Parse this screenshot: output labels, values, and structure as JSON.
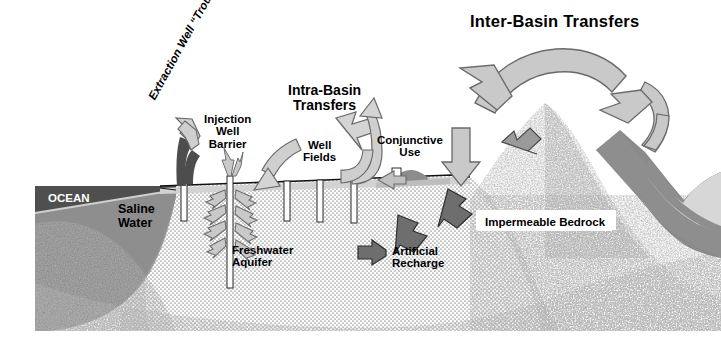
{
  "figure": {
    "type": "cross-section-diagram"
  },
  "labels": {
    "inter_basin": "Inter-Basin Transfers",
    "intra_basin": "Intra-Basin\nTransfers",
    "injection_well": "Injection\nWell\nBarrier",
    "well_fields": "Well\nFields",
    "conjunctive_use": "Conjunctive\nUse",
    "extraction_well": "Extraction Well\n“Trough”",
    "ocean": "OCEAN",
    "saline_water": "Saline\nWater",
    "freshwater_aquifer": "Freshwater\nAquifer",
    "artificial_recharge": "Artificial\nRecharge",
    "impermeable_bedrock": "Impermeable Bedrock"
  },
  "icons": {
    "arrow_inter_basin_left": "curved-arc-arrow-left-icon",
    "arrow_inter_basin_right": "curved-arc-arrow-up-right-icon",
    "arrow_intra_basin_left": "curved-arrow-down-left-icon",
    "arrow_intra_basin_right": "curved-arrow-up-icon",
    "arrow_injection_down": "curved-arrow-down-icon",
    "arrow_conjunctive_down": "arrow-down-icon",
    "arrow_conjunctive_left": "arrow-left-icon",
    "arrow_mountain_recharge": "arrow-down-left-icon",
    "arrow_extraction_up": "curved-arrow-up-left-icon",
    "arrows_injection_radiating": "radiating-arrows-icon",
    "arrows_artificial_recharge": "arrow-down-left-icon"
  },
  "colors": {
    "ocean_water": "#4d4d4d",
    "saline_water": "#8a8a8a",
    "bedrock_speckle": "#808080",
    "aquifer_dots": "#d8d8d8",
    "arrow_light": "#c9c9c9",
    "arrow_dark": "#6e6e6e",
    "mountain_dark": "#8c8c8c",
    "well_casing": "#ffffff",
    "ground_line": "#000000",
    "text": "#000000"
  },
  "elements": {
    "well_count": 5,
    "aquifer_label_note": "dot-screen halftone fill",
    "bedrock_label_note": "coarse speckle fill"
  }
}
